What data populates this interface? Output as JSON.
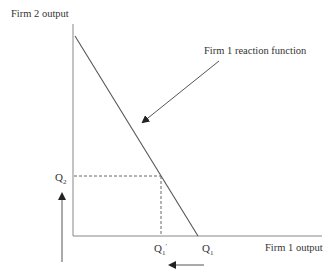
{
  "diagram": {
    "y_axis_label": "Firm 2 output",
    "x_axis_label": "Firm 1 output",
    "reaction_label": "Firm 1 reaction function",
    "q2_label": {
      "base": "Q",
      "sub": "2"
    },
    "q1_label": {
      "base": "Q",
      "sub": "1"
    },
    "q1_prime_label": {
      "base": "Q",
      "sub": "1",
      "prime": "′"
    },
    "arrows": [
      {
        "name": "firm2-output-increase",
        "direction": "up"
      },
      {
        "name": "firm1-output-decrease",
        "direction": "left"
      }
    ],
    "colors": {
      "line": "#555555",
      "text": "#333333",
      "axis": "#888888"
    }
  }
}
